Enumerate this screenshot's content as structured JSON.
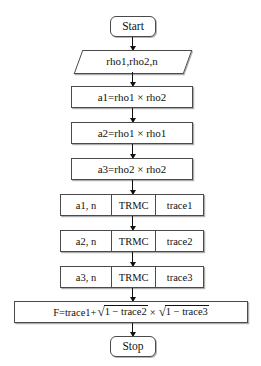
{
  "diagram": {
    "nodes": {
      "start": {
        "label": "Start",
        "type": "terminator"
      },
      "input": {
        "label": "rho1,rho2,n",
        "type": "io"
      },
      "p1": {
        "label": "a1=rho1 × rho2",
        "type": "process"
      },
      "p2": {
        "label": "a2=rho1 × rho1",
        "type": "process"
      },
      "p3": {
        "label": "a3=rho2 × rho2",
        "type": "process"
      },
      "sub1": {
        "in": "a1, n",
        "mid": "TRMC",
        "out": "trace1",
        "type": "subroutine"
      },
      "sub2": {
        "in": "a2, n",
        "mid": "TRMC",
        "out": "trace2",
        "type": "subroutine"
      },
      "sub3": {
        "in": "a3, n",
        "mid": "TRMC",
        "out": "trace3",
        "type": "subroutine"
      },
      "formula": {
        "type": "process",
        "prefix": "F=trace1+",
        "radical1_symbol": "√",
        "radicand1": "1 − trace2",
        "operator": "×",
        "radical2_symbol": "√",
        "radicand2": "1 − trace3",
        "plain_text": "F=trace1+√(1 − trace2) × √(1 − trace3)"
      },
      "stop": {
        "label": "Stop",
        "type": "terminator"
      }
    },
    "colors": {
      "stroke": "#4a4a4a",
      "text": "#111111",
      "background": "#ffffff",
      "arrow": "#111111"
    }
  }
}
